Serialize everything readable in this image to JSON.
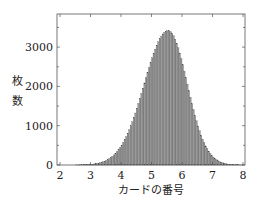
{
  "chart_data": {
    "type": "bar",
    "subtype": "histogram",
    "title": "",
    "xlabel": "カードの番号",
    "ylabel": "枚数",
    "ylabel_chars": [
      "枚",
      "数"
    ],
    "xlim": [
      1.9,
      8.1
    ],
    "ylim": [
      0,
      3800
    ],
    "xticks": [
      2,
      3,
      4,
      5,
      6,
      7,
      8
    ],
    "yticks": [
      0,
      1000,
      2000,
      3000
    ],
    "grid": false,
    "legend": null,
    "bar_color": "#9a9a9a",
    "bar_edge_color": "#444444",
    "bin_width": 0.05,
    "bin_start": 2.5,
    "bin_end": 8.0,
    "values_provenance": "Estimated model, not per-bar measurements: bar heights below were generated from an asymmetric normal fit (mean 5.55, sigma_left 0.78, sigma_right 0.62, peak 3420) to the observed peak and tails, not digitized from individual bars.",
    "model": {
      "shape": "asymmetric-normal",
      "mean": 5.55,
      "sigma_left": 0.78,
      "sigma_right": 0.62,
      "peak": 3420
    },
    "values_are_modeled": true
  }
}
